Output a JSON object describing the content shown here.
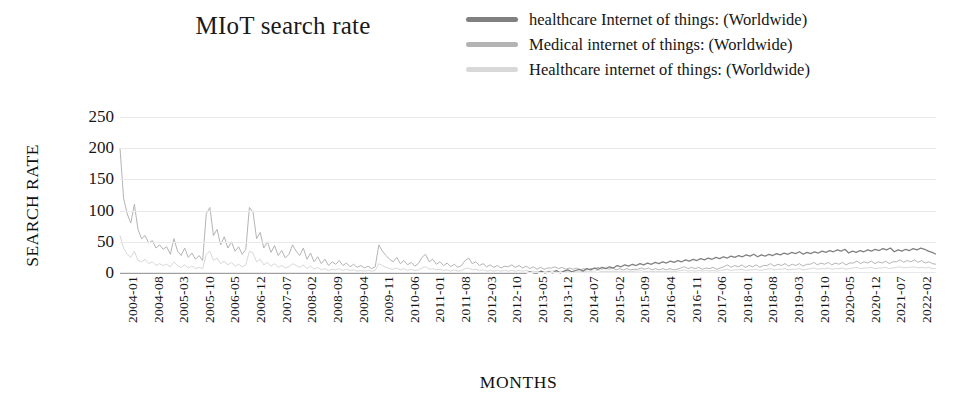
{
  "title": "MIoT search rate",
  "legend": {
    "position": "top-right",
    "items": [
      {
        "label": "healthcare Internet of things: (Worldwide)",
        "color": "#808080"
      },
      {
        "label": "Medical internet of things: (Worldwide)",
        "color": "#b4b4b4"
      },
      {
        "label": "Healthcare internet of things: (Worldwide)",
        "color": "#d8d8d8"
      }
    ]
  },
  "axes": {
    "ylabel": "SEARCH RATE",
    "xlabel": "MONTHS",
    "yticks": [
      250,
      200,
      150,
      100,
      50,
      0
    ],
    "ylim": [
      0,
      250
    ],
    "grid": true
  },
  "chart_data": {
    "type": "line",
    "title": "MIoT search rate",
    "xlabel": "MONTHS",
    "ylabel": "SEARCH RATE",
    "ylim": [
      0,
      250
    ],
    "grid": true,
    "legend_position": "top-right",
    "x_tick_labels": [
      "2004-01",
      "2004-08",
      "2005-03",
      "2005-10",
      "2006-05",
      "2006-12",
      "2007-07",
      "2008-02",
      "2008-09",
      "2009-04",
      "2009-11",
      "2010-06",
      "2011-01",
      "2011-08",
      "2012-03",
      "2012-10",
      "2013-05",
      "2013-12",
      "2014-07",
      "2015-02",
      "2015-09",
      "2016-04",
      "2016-11",
      "2017-06",
      "2018-01",
      "2018-08",
      "2019-03",
      "2019-10",
      "2020-05",
      "2020-12",
      "2021-07",
      "2022-02"
    ],
    "x_tick_step_months": 7,
    "x_start": "2004-01",
    "x_end": "2022-08",
    "n_points": 224,
    "series": [
      {
        "name": "healthcare Internet of things: (Worldwide)",
        "color": "#808080",
        "values": [
          0,
          0,
          0,
          0,
          0,
          0,
          0,
          0,
          0,
          0,
          0,
          0,
          0,
          0,
          0,
          0,
          0,
          0,
          0,
          0,
          0,
          0,
          0,
          0,
          0,
          0,
          0,
          0,
          0,
          0,
          0,
          0,
          0,
          0,
          0,
          0,
          0,
          0,
          0,
          0,
          0,
          0,
          0,
          0,
          0,
          0,
          0,
          0,
          0,
          0,
          0,
          0,
          0,
          0,
          0,
          0,
          0,
          0,
          0,
          0,
          0,
          0,
          0,
          0,
          0,
          0,
          0,
          0,
          0,
          0,
          0,
          0,
          0,
          0,
          0,
          0,
          0,
          0,
          0,
          0,
          0,
          0,
          0,
          0,
          0,
          0,
          0,
          0,
          0,
          0,
          0,
          0,
          0,
          0,
          0,
          0,
          0,
          0,
          0,
          0,
          0,
          0,
          0,
          0,
          0,
          0,
          0,
          0,
          2,
          0,
          0,
          3,
          0,
          2,
          0,
          4,
          0,
          3,
          5,
          2,
          4,
          6,
          3,
          7,
          5,
          8,
          6,
          9,
          7,
          10,
          8,
          12,
          10,
          13,
          11,
          14,
          12,
          15,
          13,
          16,
          14,
          17,
          15,
          18,
          16,
          19,
          17,
          20,
          18,
          21,
          19,
          22,
          20,
          23,
          21,
          24,
          22,
          25,
          23,
          26,
          24,
          27,
          25,
          28,
          26,
          29,
          27,
          30,
          26,
          29,
          27,
          30,
          28,
          31,
          29,
          32,
          30,
          33,
          31,
          34,
          30,
          33,
          31,
          34,
          32,
          35,
          33,
          36,
          34,
          37,
          35,
          38,
          32,
          35,
          33,
          36,
          34,
          37,
          35,
          38,
          36,
          39,
          37,
          40,
          34,
          37,
          35,
          38,
          36,
          39,
          37,
          40,
          38,
          35,
          33,
          30
        ]
      },
      {
        "name": "Medical internet of things: (Worldwide)",
        "color": "#b4b4b4",
        "values": [
          200,
          120,
          95,
          80,
          110,
          70,
          55,
          60,
          48,
          52,
          40,
          45,
          38,
          42,
          30,
          55,
          35,
          28,
          40,
          25,
          32,
          22,
          28,
          20,
          95,
          105,
          60,
          70,
          45,
          58,
          40,
          50,
          35,
          42,
          30,
          38,
          105,
          98,
          55,
          65,
          40,
          50,
          33,
          44,
          28,
          36,
          24,
          30,
          45,
          35,
          28,
          40,
          22,
          32,
          18,
          26,
          15,
          22,
          12,
          18,
          14,
          20,
          12,
          16,
          10,
          14,
          9,
          12,
          8,
          11,
          7,
          10,
          45,
          35,
          28,
          22,
          18,
          25,
          15,
          20,
          13,
          17,
          11,
          15,
          25,
          30,
          18,
          22,
          14,
          18,
          12,
          16,
          10,
          14,
          9,
          12,
          20,
          24,
          15,
          18,
          12,
          15,
          10,
          13,
          9,
          12,
          8,
          11,
          10,
          13,
          9,
          12,
          8,
          11,
          7,
          10,
          6,
          9,
          6,
          8,
          8,
          10,
          7,
          9,
          6,
          8,
          6,
          8,
          5,
          7,
          5,
          7,
          7,
          9,
          6,
          8,
          6,
          8,
          5,
          7,
          5,
          7,
          5,
          6,
          6,
          8,
          6,
          8,
          5,
          7,
          5,
          7,
          5,
          7,
          5,
          6,
          8,
          10,
          7,
          9,
          7,
          9,
          6,
          8,
          7,
          9,
          6,
          8,
          10,
          13,
          9,
          12,
          10,
          13,
          9,
          12,
          10,
          13,
          9,
          12,
          12,
          15,
          11,
          14,
          12,
          15,
          11,
          14,
          12,
          15,
          11,
          14,
          14,
          17,
          13,
          16,
          14,
          17,
          13,
          16,
          14,
          17,
          13,
          16,
          16,
          19,
          15,
          18,
          16,
          19,
          15,
          18,
          16,
          19,
          15,
          18,
          18,
          21,
          17,
          20,
          18,
          21,
          17,
          20,
          16,
          18,
          15,
          14
        ]
      },
      {
        "name": "Healthcare internet of things: (Worldwide)",
        "color": "#d8d8d8",
        "values": [
          60,
          40,
          30,
          25,
          35,
          20,
          18,
          22,
          15,
          18,
          12,
          15,
          12,
          14,
          10,
          18,
          12,
          9,
          13,
          8,
          11,
          7,
          9,
          7,
          30,
          35,
          20,
          24,
          15,
          19,
          13,
          17,
          11,
          14,
          10,
          13,
          35,
          32,
          18,
          22,
          13,
          17,
          11,
          15,
          9,
          12,
          8,
          10,
          15,
          12,
          9,
          13,
          7,
          11,
          6,
          9,
          5,
          7,
          4,
          6,
          5,
          7,
          4,
          6,
          4,
          5,
          3,
          4,
          3,
          4,
          3,
          4,
          15,
          12,
          9,
          7,
          6,
          8,
          5,
          7,
          4,
          6,
          4,
          5,
          8,
          10,
          6,
          7,
          5,
          6,
          4,
          5,
          3,
          5,
          3,
          4,
          7,
          8,
          5,
          6,
          4,
          5,
          3,
          4,
          3,
          4,
          3,
          4,
          3,
          4,
          3,
          4,
          3,
          4,
          2,
          3,
          2,
          3,
          2,
          3,
          3,
          4,
          2,
          3,
          2,
          3,
          2,
          3,
          2,
          3,
          2,
          3,
          3,
          4,
          2,
          3,
          2,
          3,
          2,
          3,
          2,
          3,
          2,
          3,
          3,
          4,
          2,
          3,
          2,
          3,
          2,
          3,
          2,
          3,
          2,
          3,
          4,
          5,
          3,
          4,
          3,
          4,
          3,
          4,
          3,
          4,
          3,
          4,
          5,
          6,
          4,
          5,
          5,
          6,
          4,
          5,
          5,
          6,
          4,
          5,
          6,
          7,
          5,
          6,
          6,
          7,
          5,
          6,
          6,
          7,
          5,
          6,
          7,
          8,
          6,
          7,
          7,
          8,
          6,
          7,
          7,
          8,
          6,
          7,
          8,
          9,
          7,
          8,
          8,
          9,
          7,
          8,
          8,
          9,
          7,
          8,
          9,
          10,
          8,
          9,
          9,
          10,
          8,
          9,
          8,
          9,
          7,
          7
        ]
      }
    ]
  }
}
